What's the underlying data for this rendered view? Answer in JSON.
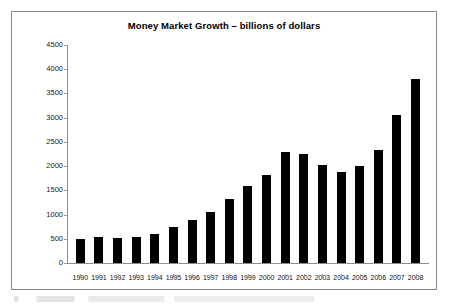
{
  "chart_data": {
    "type": "bar",
    "title": "Money Market Growth – billions of dollars",
    "xlabel": "",
    "ylabel": "",
    "ylim": [
      0,
      4500
    ],
    "ytick_step": 500,
    "yticks": [
      "4500",
      "4000",
      "3500",
      "3000",
      "2500",
      "2000",
      "1500",
      "1000",
      "500",
      "0"
    ],
    "grid": false,
    "legend": "none",
    "bar_color": "#000000",
    "categories": [
      "1990",
      "1991",
      "1992",
      "1993",
      "1994",
      "1995",
      "1996",
      "1997",
      "1998",
      "1999",
      "2000",
      "2001",
      "2002",
      "2003",
      "2004",
      "2005",
      "2006",
      "2007",
      "2008"
    ],
    "values": [
      490,
      530,
      525,
      545,
      600,
      745,
      890,
      1045,
      1330,
      1590,
      1820,
      2285,
      2255,
      2025,
      1885,
      2010,
      2330,
      3050,
      3800
    ]
  },
  "figure": {
    "frame_color": "#8a8a8a",
    "background": "#ffffff",
    "axis_color": "#8d8d8d"
  }
}
